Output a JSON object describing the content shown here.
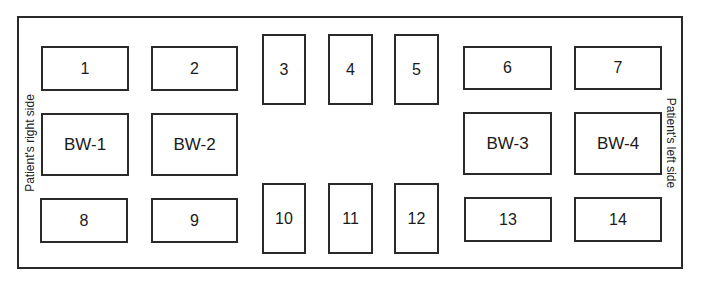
{
  "diagram": {
    "type": "dental-radiograph-mount-layout",
    "side_labels": {
      "left_edge": "Patient's right side",
      "right_edge": "Patient's left side"
    },
    "boxes": [
      {
        "id": "1",
        "label": "1",
        "x": 41,
        "y": 46,
        "w": 88,
        "h": 45,
        "kind": "periapical-horizontal"
      },
      {
        "id": "2",
        "label": "2",
        "x": 151,
        "y": 46,
        "w": 87,
        "h": 45,
        "kind": "periapical-horizontal"
      },
      {
        "id": "3",
        "label": "3",
        "x": 262,
        "y": 34,
        "w": 44,
        "h": 71,
        "kind": "periapical-vertical"
      },
      {
        "id": "4",
        "label": "4",
        "x": 328,
        "y": 34,
        "w": 45,
        "h": 71,
        "kind": "periapical-vertical"
      },
      {
        "id": "5",
        "label": "5",
        "x": 394,
        "y": 34,
        "w": 45,
        "h": 71,
        "kind": "periapical-vertical"
      },
      {
        "id": "6",
        "label": "6",
        "x": 463,
        "y": 46,
        "w": 89,
        "h": 44,
        "kind": "periapical-horizontal"
      },
      {
        "id": "7",
        "label": "7",
        "x": 574,
        "y": 46,
        "w": 88,
        "h": 44,
        "kind": "periapical-horizontal"
      },
      {
        "id": "BW-1",
        "label": "BW-1",
        "x": 41,
        "y": 113,
        "w": 88,
        "h": 63,
        "kind": "bitewing"
      },
      {
        "id": "BW-2",
        "label": "BW-2",
        "x": 151,
        "y": 113,
        "w": 87,
        "h": 63,
        "kind": "bitewing"
      },
      {
        "id": "BW-3",
        "label": "BW-3",
        "x": 463,
        "y": 112,
        "w": 89,
        "h": 63,
        "kind": "bitewing"
      },
      {
        "id": "BW-4",
        "label": "BW-4",
        "x": 574,
        "y": 112,
        "w": 88,
        "h": 63,
        "kind": "bitewing"
      },
      {
        "id": "8",
        "label": "8",
        "x": 40,
        "y": 198,
        "w": 88,
        "h": 45,
        "kind": "periapical-horizontal"
      },
      {
        "id": "9",
        "label": "9",
        "x": 151,
        "y": 198,
        "w": 87,
        "h": 45,
        "kind": "periapical-horizontal"
      },
      {
        "id": "10",
        "label": "10",
        "x": 262,
        "y": 183,
        "w": 44,
        "h": 71,
        "kind": "periapical-vertical"
      },
      {
        "id": "11",
        "label": "11",
        "x": 328,
        "y": 183,
        "w": 45,
        "h": 71,
        "kind": "periapical-vertical"
      },
      {
        "id": "12",
        "label": "12",
        "x": 394,
        "y": 183,
        "w": 45,
        "h": 71,
        "kind": "periapical-vertical"
      },
      {
        "id": "13",
        "label": "13",
        "x": 464,
        "y": 197,
        "w": 88,
        "h": 45,
        "kind": "periapical-horizontal"
      },
      {
        "id": "14",
        "label": "14",
        "x": 574,
        "y": 197,
        "w": 88,
        "h": 45,
        "kind": "periapical-horizontal"
      }
    ]
  }
}
